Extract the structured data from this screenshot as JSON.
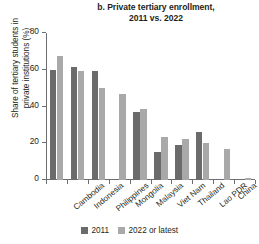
{
  "chart_data": {
    "type": "bar",
    "title": "b. Private tertiary enrollment, 2011 vs. 2022",
    "title_lines": [
      "b. Private tertiary enrollment,",
      "2011 vs. 2022"
    ],
    "xlabel": "",
    "ylabel": "Share of tertiary students in private institutions (%)",
    "ylabel_lines": [
      "Share of tertiary students in",
      "private institutions (%)"
    ],
    "ylim": [
      0,
      80
    ],
    "yticks": [
      0,
      20,
      40,
      60,
      80
    ],
    "ytick_labels": [
      "0",
      "20",
      "40",
      "60",
      "80"
    ],
    "grid": false,
    "legend_position": "bottom-center",
    "categories": [
      "Cambodia",
      "Indonesia",
      "Philippines",
      "Mongolia",
      "Malaysia",
      "Viet Nam",
      "Thailand",
      "Lao PDR",
      "China",
      "Myanmar"
    ],
    "series": [
      {
        "name": "2011",
        "color": "#6b6b6b",
        "values": [
          60,
          61.5,
          59.5,
          null,
          37,
          15.5,
          19,
          26,
          null,
          null
        ]
      },
      {
        "name": "2022 or latest",
        "color": "#a9a9a9",
        "values": [
          67.5,
          59.5,
          50,
          47,
          38.5,
          23.5,
          22.5,
          20,
          17,
          1.2
        ]
      }
    ]
  },
  "legend": {
    "items": [
      {
        "label": "2011",
        "color": "#6b6b6b"
      },
      {
        "label": "2022 or latest",
        "color": "#a9a9a9"
      }
    ]
  },
  "colors": {
    "series_2011": "#6b6b6b",
    "series_2022": "#a9a9a9",
    "axis": "#6d6e71",
    "text": "#231f20",
    "background": "#ffffff"
  }
}
